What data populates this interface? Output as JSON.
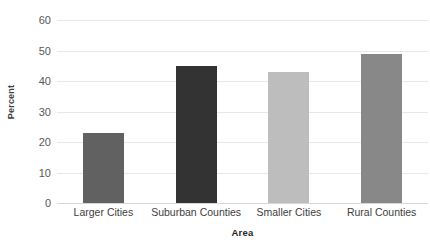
{
  "chart_data": {
    "type": "bar",
    "title": "",
    "xlabel": "Area",
    "ylabel": "Percent",
    "categories": [
      "Larger Cities",
      "Suburban Counties",
      "Smaller Cities",
      "Rural Counties"
    ],
    "values": [
      23,
      45,
      43,
      49
    ],
    "bar_colors": [
      "#616161",
      "#333333",
      "#bdbdbd",
      "#888888"
    ],
    "ylim": [
      0,
      60
    ],
    "yticks": [
      0,
      10,
      20,
      30,
      40,
      50,
      60
    ],
    "ytick_labels": [
      "0",
      "10",
      "20",
      "30",
      "40",
      "50",
      "60"
    ],
    "grid": true,
    "legend": "none",
    "background": "#ffffff",
    "gridline_color": "#e8e8e8",
    "axis_text_color": "#404040"
  }
}
